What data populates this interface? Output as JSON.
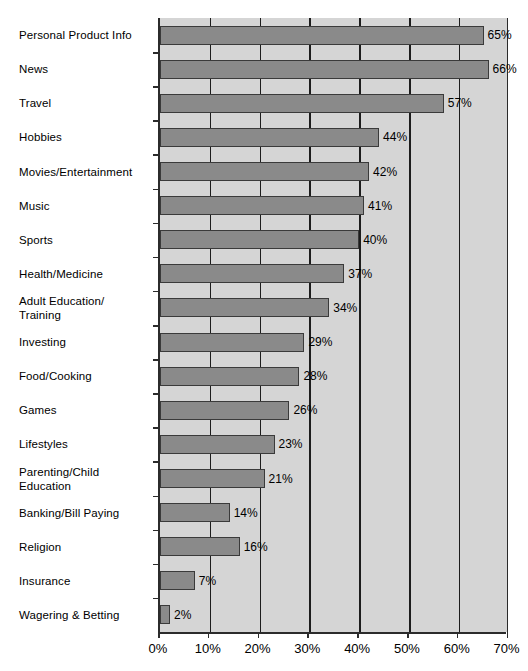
{
  "chart_data": {
    "type": "bar",
    "orientation": "horizontal",
    "title": "",
    "subtitle": "",
    "xlabel": "",
    "ylabel": "",
    "xlim": [
      0,
      70
    ],
    "xtick_labels": [
      "0%",
      "10%",
      "20%",
      "30%",
      "40%",
      "50%",
      "60%",
      "70%"
    ],
    "xtick_values": [
      0,
      10,
      20,
      30,
      40,
      50,
      60,
      70
    ],
    "grid": true,
    "legend": false,
    "value_suffix": "%",
    "categories": [
      "Personal Product Info",
      "News",
      "Travel",
      "Hobbies",
      "Movies/Entertainment",
      "Music",
      "Sports",
      "Health/Medicine",
      "Adult Education/\nTraining",
      "Investing",
      "Food/Cooking",
      "Games",
      "Lifestyles",
      "Parenting/Child\nEducation",
      "Banking/Bill Paying",
      "Religion",
      "Insurance",
      "Wagering & Betting"
    ],
    "values": [
      65,
      66,
      57,
      44,
      42,
      41,
      40,
      37,
      34,
      29,
      28,
      26,
      23,
      21,
      14,
      16,
      7,
      2
    ],
    "value_labels": [
      "65%",
      "66%",
      "57%",
      "44%",
      "42%",
      "41%",
      "40%",
      "37%",
      "34%",
      "29%",
      "28%",
      "26%",
      "23%",
      "21%",
      "14%",
      "16%",
      "7%",
      "2%"
    ]
  },
  "style": {
    "bar_fill": "#8a8a8a",
    "bar_stroke": "#3a3a3a",
    "plot_background": "#d5d5d5",
    "grid_color": "#1c1c1c",
    "axis_color": "#2b2b2b",
    "text_color": "#000000",
    "page_background": "#ffffff"
  }
}
